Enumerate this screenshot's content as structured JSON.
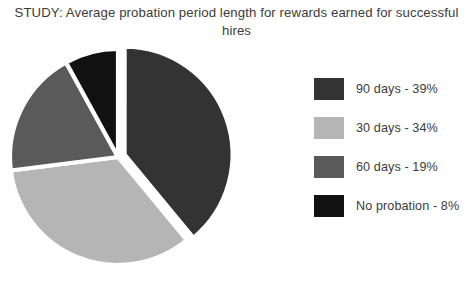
{
  "chart_data": {
    "type": "pie",
    "title": "STUDY: Average probation period length for rewards earned for successful hires",
    "title_line1": "STUDY: Average probation period length for rewards earned for",
    "title_line2": "successful hires",
    "categories": [
      "90 days",
      "30 days",
      "60 days",
      "No probation"
    ],
    "values": [
      39,
      34,
      19,
      8
    ],
    "value_unit": "%",
    "colors": [
      "#333333",
      "#b5b5b5",
      "#5a5a5a",
      "#111111"
    ],
    "legend_position": "right",
    "start_angle_deg": 0,
    "direction": "clockwise",
    "exploded_slice_index": 0,
    "grid": false,
    "xlabel": "",
    "ylabel": "",
    "legend": [
      {
        "label": "90 days - 39%",
        "color": "#333333",
        "category": "90 days",
        "value": 39
      },
      {
        "label": "30 days - 34%",
        "color": "#b5b5b5",
        "category": "30 days",
        "value": 34
      },
      {
        "label": "60 days - 19%",
        "color": "#5a5a5a",
        "category": "60 days",
        "value": 19
      },
      {
        "label": "No probation - 8%",
        "color": "#111111",
        "category": "No probation",
        "value": 8
      }
    ]
  },
  "background": "#ffffff",
  "text_color": "#3c3c3c"
}
